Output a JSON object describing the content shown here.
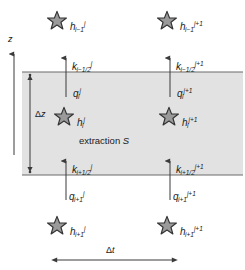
{
  "figure": {
    "type": "finite-difference-cell-diagram",
    "background": "#ffffff",
    "cell_fill": "#e2e2e2",
    "line_color": "#6b6b6b",
    "star_fill": "#9a9a9a",
    "star_stroke": "#3a3a3a",
    "text_color": "#1a1a1a"
  },
  "axis": {
    "z_label": "z",
    "dz_label_greek": "Δ",
    "dz_label_var": "z",
    "dt_label_greek": "Δ",
    "dt_label_var": "t"
  },
  "cell": {
    "note_text": "extraction ",
    "note_symbol": "S"
  },
  "nodes": [
    {
      "name": "h-top-left",
      "base": "h",
      "sub": "i−1",
      "sup": "j",
      "x": 70,
      "y": 17
    },
    {
      "name": "h-top-right",
      "base": "h",
      "sub": "i−1",
      "sup": "j+1",
      "x": 180,
      "y": 17
    },
    {
      "name": "h-center-left",
      "base": "h",
      "sub": "i",
      "sup": "j",
      "x": 77,
      "y": 113
    },
    {
      "name": "h-center-right",
      "base": "h",
      "sub": "i",
      "sup": "j+1",
      "x": 182,
      "y": 113
    },
    {
      "name": "h-bottom-left",
      "base": "h",
      "sub": "i+1",
      "sup": "j",
      "x": 70,
      "y": 222
    },
    {
      "name": "h-bottom-right",
      "base": "h",
      "sub": "i+1",
      "sup": "j+1",
      "x": 180,
      "y": 222
    }
  ],
  "stars": [
    {
      "name": "star-h-top-left",
      "cx": 57,
      "cy": 21
    },
    {
      "name": "star-h-top-right",
      "cx": 167,
      "cy": 21
    },
    {
      "name": "star-h-center-left",
      "cx": 64,
      "cy": 117
    },
    {
      "name": "star-h-center-right",
      "cx": 169,
      "cy": 117
    },
    {
      "name": "star-h-bottom-left",
      "cx": 57,
      "cy": 226
    },
    {
      "name": "star-h-bottom-right",
      "cx": 167,
      "cy": 226
    }
  ],
  "conductivities": [
    {
      "name": "k-top-left",
      "base": "k",
      "sub": "i−1/2",
      "sup": "j",
      "x": 72,
      "y": 57
    },
    {
      "name": "k-top-right",
      "base": "k",
      "sub": "i−1/2",
      "sup": "j+1",
      "x": 176,
      "y": 57
    },
    {
      "name": "k-bottom-left",
      "base": "k",
      "sub": "i+1/2",
      "sup": "j",
      "x": 72,
      "y": 160
    },
    {
      "name": "k-bottom-right",
      "base": "k",
      "sub": "i+1/2",
      "sup": "j+1",
      "x": 176,
      "y": 160
    }
  ],
  "fluxes": [
    {
      "name": "q-top-left",
      "base": "q",
      "sub": "i",
      "sup": "j",
      "x": 73,
      "y": 84
    },
    {
      "name": "q-top-right",
      "base": "q",
      "sub": "i",
      "sup": "j+1",
      "x": 177,
      "y": 84
    },
    {
      "name": "q-bottom-left",
      "base": "q",
      "sub": "i+1",
      "sup": "j",
      "x": 69,
      "y": 187
    },
    {
      "name": "q-bottom-right",
      "base": "q",
      "sub": "i+1",
      "sup": "j+1",
      "x": 173,
      "y": 187
    }
  ]
}
